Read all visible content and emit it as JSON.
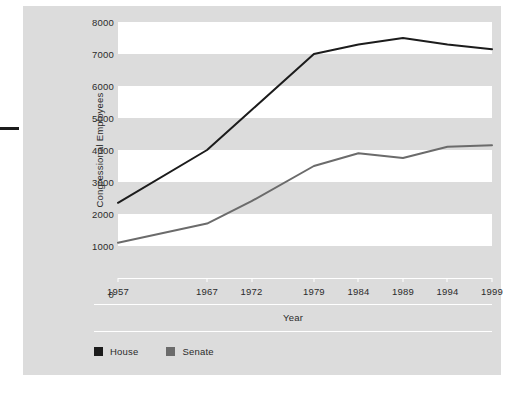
{
  "chart_data": {
    "type": "line",
    "title": "",
    "subtitle": "",
    "xlabel": "Year",
    "ylabel": "Congressional Employees",
    "x": [
      1957,
      1967,
      1972,
      1979,
      1984,
      1989,
      1994,
      1999
    ],
    "x_tick_labels": [
      "1957",
      "1967",
      "1972",
      "1979",
      "1984",
      "1989",
      "1994",
      "1999"
    ],
    "y_tick_labels": [
      "0",
      "1000",
      "2000",
      "3000",
      "4000",
      "5000",
      "6000",
      "7000",
      "8000"
    ],
    "y_ticks": [
      0,
      1000,
      2000,
      3000,
      4000,
      5000,
      6000,
      7000,
      8000
    ],
    "ylim": [
      0,
      8000
    ],
    "xlim": [
      1957,
      1999
    ],
    "grid": false,
    "banded_background": true,
    "legend_position": "bottom-left",
    "series": [
      {
        "name": "House",
        "color": "#1c1c1c",
        "values": [
          2350,
          4000,
          5250,
          7000,
          7300,
          7500,
          7300,
          7150
        ]
      },
      {
        "name": "Senate",
        "color": "#6b6b6b",
        "values": [
          1100,
          1700,
          2400,
          3500,
          3900,
          3750,
          4100,
          4150
        ]
      }
    ]
  },
  "legend": {
    "items": [
      {
        "label": "House",
        "color": "#1c1c1c"
      },
      {
        "label": "Senate",
        "color": "#6b6b6b"
      }
    ]
  },
  "colors": {
    "panel_background": "#dcdcdc",
    "band_white": "#ffffff",
    "house_line": "#1c1c1c",
    "senate_line": "#6b6b6b",
    "text": "#2b2b2b"
  }
}
